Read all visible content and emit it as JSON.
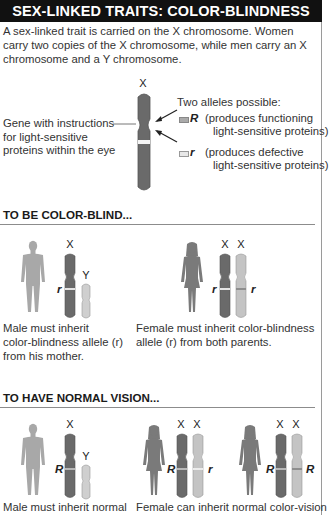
{
  "title": "SEX-LINKED TRAITS: COLOR-BLINDNESS",
  "intro": "A sex-linked trait is carried on the X chromosome. Women carry two copies of the X chromosome, while men carry an X chromosome and a Y chromosome.",
  "diagram": {
    "chromosome_label": "X",
    "gene_label": [
      "Gene with instructions",
      "for light-sensitive",
      "proteins within the eye"
    ],
    "alleles_heading": "Two alleles possible:",
    "alleles": [
      {
        "symbol": "R",
        "desc_line1": "(produces functioning",
        "desc_line2": "light-sensitive proteins)"
      },
      {
        "symbol": "r",
        "desc_line1": "(produces defective",
        "desc_line2": "light-sensitive proteins)"
      }
    ]
  },
  "sections": [
    {
      "heading": "TO BE COLOR-BLIND...",
      "cases": [
        {
          "figure": "male",
          "chromosomes": [
            "X",
            "Y"
          ],
          "alleles": [
            "r",
            ""
          ],
          "caption_lines": [
            "Male must inherit",
            "color-blindness allele (r)",
            "from his mother."
          ]
        },
        {
          "figure": "female",
          "chromosomes": [
            "X",
            "X"
          ],
          "alleles": [
            "r",
            "r"
          ],
          "caption_lines": [
            "Female must inherit color-blindness",
            "allele (r) from both parents."
          ]
        }
      ]
    },
    {
      "heading": "TO HAVE NORMAL VISION...",
      "cases": [
        {
          "figure": "male",
          "chromosomes": [
            "X",
            "Y"
          ],
          "alleles": [
            "R",
            ""
          ],
          "caption_lines": [
            "Male must inherit normal"
          ]
        },
        {
          "figure": "female",
          "chromosomes": [
            "X",
            "X"
          ],
          "alleles": [
            "R",
            "r"
          ],
          "caption_lines": [
            "Female can inherit normal color-vision"
          ]
        },
        {
          "figure": "female",
          "chromosomes": [
            "X",
            "X"
          ],
          "alleles": [
            "R",
            "R"
          ],
          "caption_lines": []
        }
      ]
    }
  ],
  "colors": {
    "title_bg": "#111111",
    "dark_chromosome": "#6a6a6a",
    "light_chromosome": "#c4c4c4",
    "male_figure": "#a8a8a8",
    "female_figure": "#7a7a7a",
    "rule": "#8c8c8c"
  }
}
